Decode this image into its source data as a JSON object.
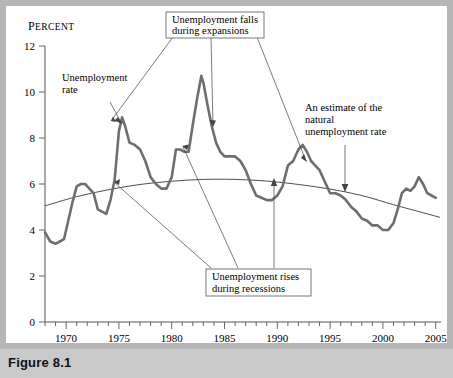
{
  "figure": {
    "caption": "Figure 8.1"
  },
  "chart_data": {
    "type": "line",
    "title": "",
    "xlabel": "",
    "ylabel": "PERCENT",
    "ylabel_display": "Percent",
    "xlim": [
      1968,
      2005.5
    ],
    "ylim": [
      0,
      12
    ],
    "grid": false,
    "legend_position": "none",
    "yticks": [
      0,
      2,
      4,
      6,
      8,
      10,
      12
    ],
    "ytick_labels": [
      "0",
      "2",
      "4",
      "6",
      "8",
      "10",
      "12"
    ],
    "xticks": [
      1970,
      1975,
      1980,
      1985,
      1990,
      1995,
      2000,
      2005
    ],
    "xtick_labels": [
      "1970",
      "1975",
      "1980",
      "1985",
      "1990",
      "1995",
      "2000",
      "2005"
    ],
    "x_minor_tick_step": 1,
    "series": [
      {
        "name": "Unemployment rate",
        "color": "#6e6e6e",
        "x": [
          1968.0,
          1968.5,
          1969.0,
          1969.4,
          1969.8,
          1970.2,
          1970.6,
          1971.0,
          1971.4,
          1971.8,
          1972.2,
          1972.6,
          1973.0,
          1973.4,
          1973.8,
          1974.2,
          1974.6,
          1975.0,
          1975.3,
          1975.6,
          1976.0,
          1976.5,
          1977.0,
          1977.5,
          1978.0,
          1978.5,
          1979.0,
          1979.5,
          1980.0,
          1980.4,
          1980.8,
          1981.2,
          1981.6,
          1982.0,
          1982.4,
          1982.8,
          1983.0,
          1983.4,
          1983.8,
          1984.2,
          1984.6,
          1985.0,
          1985.5,
          1986.0,
          1986.5,
          1987.0,
          1987.5,
          1988.0,
          1988.5,
          1989.0,
          1989.5,
          1990.0,
          1990.5,
          1991.0,
          1991.5,
          1992.0,
          1992.4,
          1992.8,
          1993.2,
          1993.6,
          1994.0,
          1994.5,
          1995.0,
          1995.5,
          1996.0,
          1996.5,
          1997.0,
          1997.5,
          1998.0,
          1998.5,
          1999.0,
          1999.5,
          2000.0,
          2000.5,
          2001.0,
          2001.4,
          2001.8,
          2002.2,
          2002.6,
          2003.0,
          2003.4,
          2003.8,
          2004.2,
          2004.6,
          2005.0
        ],
        "y": [
          3.9,
          3.5,
          3.4,
          3.5,
          3.6,
          4.4,
          5.2,
          5.9,
          6.0,
          6.0,
          5.8,
          5.6,
          4.9,
          4.8,
          4.7,
          5.3,
          6.2,
          8.3,
          8.9,
          8.5,
          7.8,
          7.7,
          7.5,
          7.0,
          6.3,
          6.0,
          5.8,
          5.8,
          6.3,
          7.5,
          7.5,
          7.4,
          7.4,
          8.6,
          9.7,
          10.7,
          10.4,
          9.4,
          8.5,
          7.8,
          7.4,
          7.2,
          7.2,
          7.2,
          7.0,
          6.6,
          6.0,
          5.5,
          5.4,
          5.3,
          5.3,
          5.5,
          5.9,
          6.8,
          7.0,
          7.5,
          7.7,
          7.4,
          7.0,
          6.8,
          6.6,
          6.1,
          5.6,
          5.6,
          5.5,
          5.3,
          5.0,
          4.8,
          4.5,
          4.4,
          4.2,
          4.2,
          4.0,
          4.0,
          4.3,
          4.9,
          5.6,
          5.8,
          5.7,
          5.9,
          6.3,
          6.0,
          5.6,
          5.5,
          5.4
        ],
        "annotated_peaks": [
          {
            "year": 1975,
            "value": 8.9
          },
          {
            "year": 1982.8,
            "value": 10.7
          },
          {
            "year": 1992.4,
            "value": 7.7
          },
          {
            "year": 2003.4,
            "value": 6.3
          }
        ],
        "annotated_troughs": [
          {
            "year": 1969,
            "value": 3.4
          },
          {
            "year": 1973.6,
            "value": 4.7
          },
          {
            "year": 1989.3,
            "value": 5.3
          },
          {
            "year": 2000.2,
            "value": 4.0
          }
        ]
      },
      {
        "name": "An estimate of the natural unemployment rate",
        "color": "#3a3a3a",
        "x": [
          1968,
          1971,
          1974,
          1977,
          1980,
          1983,
          1986,
          1989,
          1992,
          1995,
          1998,
          2001,
          2003,
          2005.4
        ],
        "y": [
          5.05,
          5.45,
          5.75,
          5.98,
          6.12,
          6.2,
          6.2,
          6.13,
          5.98,
          5.78,
          5.5,
          5.1,
          4.85,
          4.55
        ]
      }
    ],
    "annotations": [
      {
        "id": "falls-expansions",
        "text_lines": [
          "Unemployment falls",
          "during expansions"
        ],
        "boxed": true,
        "points_to": [
          "1977.5 declining segment",
          "1983.5 declining segment",
          "1993.5 declining segment"
        ]
      },
      {
        "id": "rises-recessions",
        "text_lines": [
          "Unemployment rises",
          "during recessions"
        ],
        "boxed": true,
        "points_to": [
          "1974.8 rising segment",
          "1981.5 rising segment",
          "1990.8 rising segment"
        ]
      },
      {
        "id": "unemployment-rate-label",
        "text_lines": [
          "Unemployment",
          "rate"
        ],
        "boxed": false,
        "points_to": [
          "1975 peak"
        ]
      },
      {
        "id": "natural-rate-label",
        "text_lines": [
          "An estimate of the",
          "natural",
          "unemployment rate"
        ],
        "boxed": false,
        "points_to": [
          "natural rate curve near 1998"
        ]
      }
    ]
  },
  "colors": {
    "page_background": "#b6b6b6",
    "panel_background": "#ffffff",
    "footer_band": "#c9c9c9",
    "series_unemployment": "#6e6e6e",
    "series_natural": "#3a3a3a",
    "axis": "#555555",
    "text": "#000000"
  }
}
